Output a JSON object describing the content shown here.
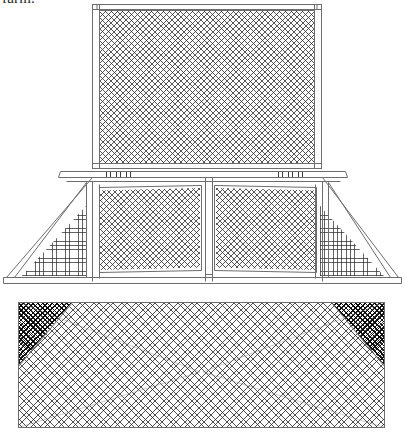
{
  "page": {
    "width": 405,
    "height": 438,
    "background_color": "#ffffff",
    "caption_text": "farm.",
    "ink_color": "#3a3a3a",
    "mesh_color": "#282828"
  },
  "drawing": {
    "title": "Mesh enclosure perspective line drawing",
    "subject": "wire-mesh cage / coop structure shown in three-quarter perspective",
    "line_style": "thin outline, no fill",
    "parts": [
      {
        "id": "upper-screen-panel",
        "label": "upper screen panel",
        "shape": "rectangle",
        "mesh": "diagonal cross-hatch",
        "x": 92,
        "y": 4,
        "width": 230,
        "height": 164
      },
      {
        "id": "upper-panel-frame",
        "label": "upper panel frame",
        "shape": "rectangle outline",
        "x": 92,
        "y": 4,
        "width": 230,
        "height": 164
      },
      {
        "id": "top-rail",
        "label": "top rail",
        "shape": "horizontal bar",
        "x": 92,
        "y": 4,
        "width": 230,
        "height": 6
      },
      {
        "id": "mid-rail",
        "label": "middle rail with hinges",
        "shape": "horizontal bar",
        "x": 60,
        "y": 170,
        "width": 285,
        "height": 10
      },
      {
        "id": "mid-panel-left",
        "label": "left middle screen panel",
        "shape": "trapezoid",
        "mesh": "diagonal cross-hatch",
        "x": 98,
        "y": 186,
        "width": 104,
        "height": 86
      },
      {
        "id": "mid-panel-right",
        "label": "right middle screen panel",
        "shape": "trapezoid",
        "mesh": "diagonal cross-hatch",
        "x": 214,
        "y": 186,
        "width": 104,
        "height": 86
      },
      {
        "id": "center-post",
        "label": "center divider post",
        "shape": "vertical bar",
        "x": 205,
        "y": 176,
        "width": 8,
        "height": 104
      },
      {
        "id": "side-wing-left",
        "label": "left side wing panel",
        "shape": "right triangle",
        "mesh": "orthogonal grid",
        "x": 22,
        "y": 205,
        "width": 64,
        "height": 72
      },
      {
        "id": "side-wing-right",
        "label": "right side wing panel",
        "shape": "right triangle",
        "mesh": "orthogonal grid",
        "x": 320,
        "y": 205,
        "width": 64,
        "height": 72
      },
      {
        "id": "base-rail",
        "label": "base rail",
        "shape": "horizontal bar",
        "x": 6,
        "y": 276,
        "width": 393,
        "height": 8
      },
      {
        "id": "lower-screen-panel",
        "label": "lower screen panel",
        "shape": "rectangle",
        "mesh": "fine diagonal cross-hatch",
        "x": 18,
        "y": 302,
        "width": 367,
        "height": 126
      },
      {
        "id": "lower-wedge-left",
        "label": "left dark corner wedge",
        "shape": "triangle",
        "x": 18,
        "y": 302,
        "width": 52,
        "height": 62
      },
      {
        "id": "lower-wedge-right",
        "label": "right dark corner wedge",
        "shape": "triangle",
        "x": 333,
        "y": 302,
        "width": 52,
        "height": 62
      }
    ],
    "hardware": {
      "label": "hinge marks",
      "count": 8,
      "note": "small tick pairs along the middle rail"
    }
  }
}
